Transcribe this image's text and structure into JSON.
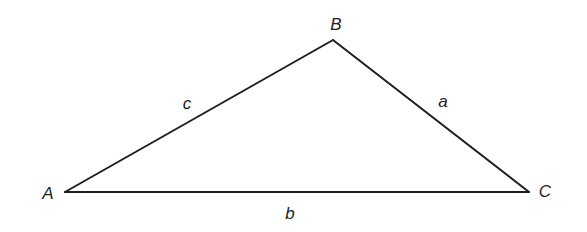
{
  "diagram": {
    "type": "triangle",
    "stroke_color": "#1e1e1e",
    "background": "#ffffff",
    "vertices": [
      {
        "name": "A",
        "x": 65,
        "y": 192,
        "label_x": 48,
        "label_y": 199
      },
      {
        "name": "B",
        "x": 333,
        "y": 40,
        "label_x": 336,
        "label_y": 30
      },
      {
        "name": "C",
        "x": 529,
        "y": 192,
        "label_x": 545,
        "label_y": 197
      }
    ],
    "sides": [
      {
        "name": "c",
        "from": "A",
        "to": "B",
        "label_x": 187,
        "label_y": 109
      },
      {
        "name": "a",
        "from": "B",
        "to": "C",
        "label_x": 443,
        "label_y": 107
      },
      {
        "name": "b",
        "from": "A",
        "to": "C",
        "label_x": 290,
        "label_y": 219
      }
    ]
  }
}
